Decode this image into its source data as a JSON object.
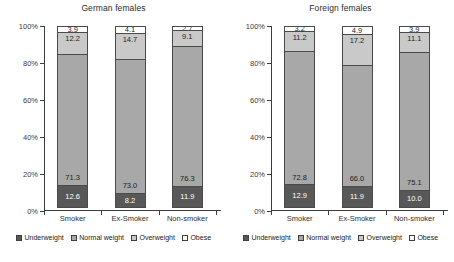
{
  "chart_data": [
    {
      "type": "bar",
      "title": "German females",
      "xlabel": "",
      "ylabel": "",
      "ylim": [
        0,
        100
      ],
      "ytick_labels": [
        "0%",
        "20%",
        "40%",
        "60%",
        "80%",
        "100%"
      ],
      "yticks": [
        0,
        20,
        40,
        60,
        80,
        100
      ],
      "grid": false,
      "stacked": true,
      "legend_position": "bottom",
      "categories": [
        "Smoker",
        "Ex-Smoker",
        "Non-smoker"
      ],
      "series": [
        {
          "name": "Underweight",
          "color": "#585858",
          "values": [
            12.6,
            8.2,
            11.9
          ]
        },
        {
          "name": "Normal weight",
          "color": "#a8a8a8",
          "values": [
            71.3,
            73.0,
            76.3
          ]
        },
        {
          "name": "Overweight",
          "color": "#c9c9c9",
          "values": [
            12.2,
            14.7,
            9.1
          ]
        },
        {
          "name": "Obese",
          "color": "#ffffff",
          "values": [
            3.9,
            4.1,
            2.7
          ]
        }
      ]
    },
    {
      "type": "bar",
      "title": "Foreign females",
      "xlabel": "",
      "ylabel": "",
      "ylim": [
        0,
        100
      ],
      "ytick_labels": [
        "0%",
        "20%",
        "40%",
        "60%",
        "80%",
        "100%"
      ],
      "yticks": [
        0,
        20,
        40,
        60,
        80,
        100
      ],
      "grid": false,
      "stacked": true,
      "legend_position": "bottom",
      "categories": [
        "Smoker",
        "Ex-Smoker",
        "Non-smoker"
      ],
      "series": [
        {
          "name": "Underweight",
          "color": "#585858",
          "values": [
            12.9,
            11.9,
            10.0
          ]
        },
        {
          "name": "Normal weight",
          "color": "#a8a8a8",
          "values": [
            72.8,
            66.0,
            75.1
          ]
        },
        {
          "name": "Overweight",
          "color": "#c9c9c9",
          "values": [
            11.2,
            17.2,
            11.1
          ]
        },
        {
          "name": "Obese",
          "color": "#ffffff",
          "values": [
            3.2,
            4.9,
            3.9
          ]
        }
      ]
    }
  ]
}
